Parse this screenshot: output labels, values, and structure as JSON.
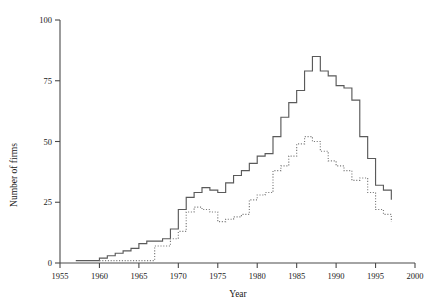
{
  "chart_data": {
    "type": "line",
    "title": "",
    "subtitle": "",
    "xlabel": "Year",
    "ylabel": "Number of firms",
    "xlim": [
      1955,
      2000
    ],
    "ylim": [
      0,
      100
    ],
    "xticks": [
      1955,
      1960,
      1965,
      1970,
      1975,
      1980,
      1985,
      1990,
      1995,
      2000
    ],
    "xtick_labels": [
      "1955",
      "1960",
      "1965",
      "1970",
      "1975",
      "1980",
      "1985",
      "1990",
      "1995",
      "2000"
    ],
    "yticks": [
      0,
      25,
      50,
      75,
      100
    ],
    "ytick_labels": [
      "0",
      "25",
      "50",
      "75",
      "100"
    ],
    "grid": false,
    "legend": "none",
    "drawstyle": "steps-post",
    "annotations": [],
    "series": [
      {
        "name": "solid-series",
        "style": "solid",
        "color": "#5a5a5a",
        "x": [
          1957,
          1958,
          1959,
          1960,
          1961,
          1962,
          1963,
          1964,
          1965,
          1966,
          1967,
          1968,
          1969,
          1970,
          1971,
          1972,
          1973,
          1974,
          1975,
          1976,
          1977,
          1978,
          1979,
          1980,
          1981,
          1982,
          1983,
          1984,
          1985,
          1986,
          1987,
          1988,
          1989,
          1990,
          1991,
          1992,
          1993,
          1994,
          1995,
          1996
        ],
        "values": [
          1,
          1,
          1,
          2,
          3,
          4,
          5,
          6,
          8,
          9,
          9,
          10,
          14,
          22,
          27,
          29,
          31,
          30,
          29,
          33,
          36,
          38,
          41,
          44,
          45,
          52,
          60,
          66,
          71,
          79,
          85,
          79,
          77,
          73,
          72,
          67,
          52,
          43,
          32,
          30
        ],
        "end_value": 26
      },
      {
        "name": "dotted-series",
        "style": "dotted",
        "color": "#7a7a7a",
        "x": [
          1960,
          1961,
          1962,
          1963,
          1964,
          1965,
          1966,
          1967,
          1968,
          1969,
          1970,
          1971,
          1972,
          1973,
          1974,
          1975,
          1976,
          1977,
          1978,
          1979,
          1980,
          1981,
          1982,
          1983,
          1984,
          1985,
          1986,
          1987,
          1988,
          1989,
          1990,
          1991,
          1992,
          1993,
          1994,
          1995,
          1996
        ],
        "values": [
          1,
          1,
          1,
          1,
          1,
          1,
          1,
          7,
          7,
          10,
          13,
          21,
          23,
          22,
          21,
          17,
          18,
          19,
          20,
          26,
          28,
          29,
          38,
          40,
          44,
          49,
          52,
          50,
          46,
          42,
          40,
          38,
          34,
          35,
          29,
          22,
          20
        ],
        "end_value": 17
      }
    ]
  }
}
